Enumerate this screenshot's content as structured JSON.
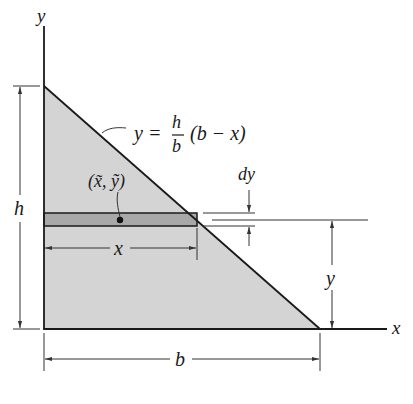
{
  "diagram": {
    "type": "area-centroid-figure",
    "colors": {
      "background": "#ffffff",
      "region_fill": "#d4d4d4",
      "strip_fill": "#a8a8a8",
      "line": "#1a1a1a",
      "dim_line": "#333333"
    },
    "axes": {
      "x_label": "x",
      "y_label": "y"
    },
    "curve_equation": {
      "lhs": "y =",
      "frac_num": "h",
      "frac_den": "b",
      "rhs": "(b − x)"
    },
    "element_centroid_label": "(x̃, ỹ)",
    "dimensions": {
      "height": "h",
      "base": "b",
      "strip_width": "x",
      "strip_height": "y",
      "strip_thickness": "dy"
    }
  }
}
